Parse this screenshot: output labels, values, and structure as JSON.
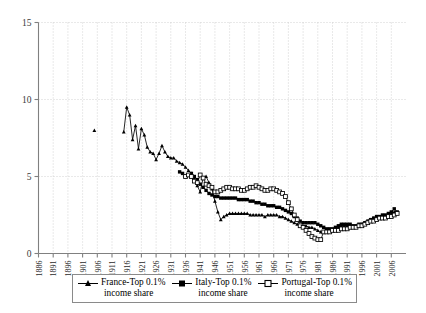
{
  "chart_data": {
    "type": "line",
    "title": "",
    "subtitle": "",
    "xlabel": "",
    "ylabel": "",
    "xlim": [
      1886,
      2011
    ],
    "ylim": [
      0,
      15
    ],
    "yticks": [
      0,
      5,
      10,
      15
    ],
    "xticks": [
      1886,
      1891,
      1896,
      1901,
      1906,
      1911,
      1916,
      1921,
      1926,
      1931,
      1936,
      1941,
      1946,
      1951,
      1956,
      1961,
      1966,
      1971,
      1976,
      1981,
      1986,
      1991,
      1996,
      2001,
      2006
    ],
    "grid": true,
    "grid_style": "dotted",
    "legend_position": "bottom",
    "series": [
      {
        "name": "France-Top 0.1% income share",
        "legend_line1": "France-Top 0.1%",
        "legend_line2": "income share",
        "marker": "triangle-filled",
        "color": "#000000",
        "points": [
          [
            1905,
            8.0
          ],
          [
            1915,
            7.9
          ],
          [
            1916,
            9.5
          ],
          [
            1917,
            9.0
          ],
          [
            1918,
            7.4
          ],
          [
            1919,
            8.3
          ],
          [
            1920,
            6.8
          ],
          [
            1921,
            8.1
          ],
          [
            1922,
            7.7
          ],
          [
            1923,
            6.9
          ],
          [
            1924,
            6.6
          ],
          [
            1925,
            6.5
          ],
          [
            1926,
            6.1
          ],
          [
            1927,
            6.5
          ],
          [
            1928,
            7.0
          ],
          [
            1929,
            6.6
          ],
          [
            1930,
            6.3
          ],
          [
            1931,
            6.2
          ],
          [
            1932,
            6.2
          ],
          [
            1933,
            6.0
          ],
          [
            1934,
            5.9
          ],
          [
            1935,
            5.8
          ],
          [
            1936,
            5.6
          ],
          [
            1937,
            5.4
          ],
          [
            1938,
            5.2
          ],
          [
            1939,
            4.9
          ],
          [
            1940,
            4.4
          ],
          [
            1941,
            4.0
          ],
          [
            1942,
            4.9
          ],
          [
            1943,
            5.0
          ],
          [
            1944,
            4.6
          ],
          [
            1945,
            4.2
          ],
          [
            1946,
            3.4
          ],
          [
            1947,
            2.7
          ],
          [
            1948,
            2.2
          ],
          [
            1949,
            2.4
          ],
          [
            1950,
            2.5
          ],
          [
            1951,
            2.6
          ],
          [
            1952,
            2.6
          ],
          [
            1953,
            2.6
          ],
          [
            1954,
            2.6
          ],
          [
            1955,
            2.6
          ],
          [
            1956,
            2.6
          ],
          [
            1957,
            2.6
          ],
          [
            1958,
            2.5
          ],
          [
            1959,
            2.5
          ],
          [
            1960,
            2.5
          ],
          [
            1961,
            2.5
          ],
          [
            1962,
            2.5
          ],
          [
            1963,
            2.4
          ],
          [
            1964,
            2.5
          ],
          [
            1965,
            2.5
          ],
          [
            1966,
            2.5
          ],
          [
            1967,
            2.5
          ],
          [
            1968,
            2.4
          ],
          [
            1969,
            2.4
          ],
          [
            1970,
            2.3
          ],
          [
            1971,
            2.2
          ],
          [
            1972,
            2.1
          ],
          [
            1973,
            2.0
          ],
          [
            1974,
            1.9
          ],
          [
            1975,
            1.8
          ],
          [
            1976,
            1.8
          ],
          [
            1977,
            1.8
          ],
          [
            1978,
            1.7
          ],
          [
            1979,
            1.7
          ],
          [
            1980,
            1.6
          ],
          [
            1981,
            1.5
          ],
          [
            1982,
            1.4
          ],
          [
            1983,
            1.4
          ],
          [
            1984,
            1.4
          ],
          [
            1985,
            1.4
          ],
          [
            1986,
            1.5
          ],
          [
            1987,
            1.6
          ],
          [
            1988,
            1.7
          ],
          [
            1989,
            1.8
          ],
          [
            1990,
            1.8
          ],
          [
            1991,
            1.8
          ],
          [
            1992,
            1.7
          ],
          [
            1993,
            1.7
          ],
          [
            1994,
            1.8
          ],
          [
            1995,
            1.8
          ],
          [
            1996,
            1.9
          ],
          [
            1997,
            2.0
          ],
          [
            1998,
            2.1
          ],
          [
            1999,
            2.2
          ],
          [
            2000,
            2.3
          ],
          [
            2001,
            2.3
          ],
          [
            2002,
            2.3
          ],
          [
            2003,
            2.3
          ],
          [
            2004,
            2.4
          ],
          [
            2005,
            2.5
          ],
          [
            2006,
            2.6
          ],
          [
            2007,
            2.7
          ],
          [
            2008,
            2.6
          ]
        ]
      },
      {
        "name": "Italy-Top 0.1% income share",
        "legend_line1": "Italy-Top 0.1%",
        "legend_line2": "income share",
        "marker": "square-filled",
        "color": "#000000",
        "points": [
          [
            1934,
            5.3
          ],
          [
            1935,
            5.2
          ],
          [
            1936,
            5.0
          ],
          [
            1937,
            5.1
          ],
          [
            1938,
            5.2
          ],
          [
            1939,
            5.0
          ],
          [
            1940,
            4.8
          ],
          [
            1941,
            4.5
          ],
          [
            1942,
            4.3
          ],
          [
            1943,
            4.1
          ],
          [
            1944,
            3.9
          ],
          [
            1945,
            3.8
          ],
          [
            1946,
            3.7
          ],
          [
            1947,
            3.7
          ],
          [
            1948,
            3.6
          ],
          [
            1949,
            3.6
          ],
          [
            1950,
            3.6
          ],
          [
            1951,
            3.6
          ],
          [
            1952,
            3.6
          ],
          [
            1953,
            3.6
          ],
          [
            1954,
            3.5
          ],
          [
            1955,
            3.5
          ],
          [
            1956,
            3.5
          ],
          [
            1957,
            3.5
          ],
          [
            1958,
            3.4
          ],
          [
            1959,
            3.4
          ],
          [
            1960,
            3.3
          ],
          [
            1961,
            3.3
          ],
          [
            1962,
            3.2
          ],
          [
            1963,
            3.2
          ],
          [
            1964,
            3.1
          ],
          [
            1965,
            3.1
          ],
          [
            1966,
            3.1
          ],
          [
            1967,
            3.0
          ],
          [
            1968,
            3.0
          ],
          [
            1969,
            2.9
          ],
          [
            1970,
            2.8
          ],
          [
            1971,
            2.7
          ],
          [
            1972,
            2.6
          ],
          [
            1973,
            2.4
          ],
          [
            1974,
            2.3
          ],
          [
            1975,
            2.1
          ],
          [
            1976,
            2.0
          ],
          [
            1977,
            2.0
          ],
          [
            1978,
            2.0
          ],
          [
            1979,
            2.0
          ],
          [
            1980,
            2.0
          ],
          [
            1981,
            1.9
          ],
          [
            1982,
            1.8
          ],
          [
            1983,
            1.7
          ],
          [
            1984,
            1.6
          ],
          [
            1985,
            1.6
          ],
          [
            1986,
            1.6
          ],
          [
            1987,
            1.7
          ],
          [
            1988,
            1.8
          ],
          [
            1989,
            1.9
          ],
          [
            1990,
            1.9
          ],
          [
            1991,
            1.9
          ],
          [
            1992,
            1.9
          ],
          [
            1993,
            1.8
          ],
          [
            1994,
            1.8
          ],
          [
            1995,
            1.9
          ],
          [
            1996,
            1.9
          ],
          [
            1997,
            2.0
          ],
          [
            1998,
            2.1
          ],
          [
            1999,
            2.2
          ],
          [
            2000,
            2.3
          ],
          [
            2001,
            2.4
          ],
          [
            2002,
            2.4
          ],
          [
            2003,
            2.5
          ],
          [
            2004,
            2.5
          ],
          [
            2005,
            2.6
          ],
          [
            2006,
            2.7
          ],
          [
            2007,
            2.9
          ],
          [
            2008,
            2.7
          ]
        ]
      },
      {
        "name": "Portugal-Top 0.1% income share",
        "legend_line1": "Portugal-Top 0.1%",
        "legend_line2": "income share",
        "marker": "square-open",
        "color": "#000000",
        "points": [
          [
            1936,
            5.0
          ],
          [
            1937,
            5.1
          ],
          [
            1938,
            5.0
          ],
          [
            1939,
            4.7
          ],
          [
            1940,
            4.6
          ],
          [
            1941,
            5.1
          ],
          [
            1942,
            4.9
          ],
          [
            1943,
            4.5
          ],
          [
            1944,
            4.4
          ],
          [
            1945,
            4.3
          ],
          [
            1946,
            4.0
          ],
          [
            1947,
            4.0
          ],
          [
            1948,
            4.1
          ],
          [
            1949,
            4.2
          ],
          [
            1950,
            4.3
          ],
          [
            1951,
            4.3
          ],
          [
            1952,
            4.2
          ],
          [
            1953,
            4.2
          ],
          [
            1954,
            4.2
          ],
          [
            1955,
            4.1
          ],
          [
            1956,
            4.1
          ],
          [
            1957,
            4.2
          ],
          [
            1958,
            4.3
          ],
          [
            1959,
            4.3
          ],
          [
            1960,
            4.4
          ],
          [
            1961,
            4.3
          ],
          [
            1962,
            4.2
          ],
          [
            1963,
            4.1
          ],
          [
            1964,
            4.1
          ],
          [
            1965,
            4.2
          ],
          [
            1966,
            4.2
          ],
          [
            1967,
            4.1
          ],
          [
            1968,
            4.0
          ],
          [
            1969,
            3.9
          ],
          [
            1970,
            3.7
          ],
          [
            1971,
            3.3
          ],
          [
            1972,
            2.9
          ],
          [
            1973,
            2.5
          ],
          [
            1974,
            2.2
          ],
          [
            1975,
            1.8
          ],
          [
            1976,
            1.7
          ],
          [
            1977,
            1.5
          ],
          [
            1978,
            1.3
          ],
          [
            1979,
            1.1
          ],
          [
            1980,
            1.0
          ],
          [
            1981,
            0.9
          ],
          [
            1982,
            0.9
          ],
          [
            1983,
            1.4
          ],
          [
            1984,
            1.4
          ],
          [
            1985,
            1.4
          ],
          [
            1986,
            1.5
          ],
          [
            1987,
            1.5
          ],
          [
            1988,
            1.5
          ],
          [
            1989,
            1.6
          ],
          [
            1990,
            1.6
          ],
          [
            1991,
            1.6
          ],
          [
            1992,
            1.7
          ],
          [
            1993,
            1.7
          ],
          [
            1994,
            1.7
          ],
          [
            1995,
            1.8
          ],
          [
            1996,
            1.8
          ],
          [
            1997,
            1.9
          ],
          [
            1998,
            2.0
          ],
          [
            1999,
            2.1
          ],
          [
            2000,
            2.1
          ],
          [
            2001,
            2.2
          ],
          [
            2002,
            2.3
          ],
          [
            2003,
            2.3
          ],
          [
            2004,
            2.3
          ],
          [
            2005,
            2.4
          ],
          [
            2006,
            2.4
          ],
          [
            2007,
            2.5
          ],
          [
            2008,
            2.6
          ]
        ]
      }
    ]
  },
  "axis": {
    "ytick_labels": [
      "0",
      "5",
      "10",
      "15"
    ],
    "xtick_labels": [
      "1886",
      "1891",
      "1896",
      "1901",
      "1906",
      "1911",
      "1916",
      "1921",
      "1926",
      "1931",
      "1936",
      "1941",
      "1946",
      "1951",
      "1956",
      "1961",
      "1966",
      "1971",
      "1976",
      "1981",
      "1986",
      "1991",
      "1996",
      "2001",
      "2006"
    ]
  },
  "colors": {
    "axis": "#808080",
    "grid": "#c8c8c8",
    "series": "#000000",
    "legend_border": "#8a8a8a"
  }
}
